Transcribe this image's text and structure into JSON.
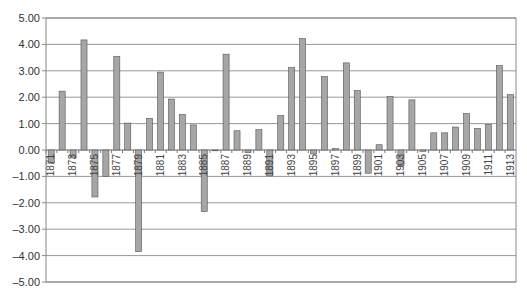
{
  "chart_data": {
    "type": "bar",
    "title": "",
    "xlabel": "",
    "ylabel": "",
    "ylim": [
      -5,
      5
    ],
    "yticks": [
      "5.00",
      "4.00",
      "3.00",
      "2.00",
      "1.00",
      "0.00",
      "-1.00",
      "-2.00",
      "-3.00",
      "-4.00",
      "-5.00"
    ],
    "grid": true,
    "legend": null,
    "bar_color": "#a6a6a6",
    "bar_edge_color": "#555555",
    "categories": [
      1871,
      1872,
      1873,
      1874,
      1875,
      1876,
      1877,
      1878,
      1879,
      1880,
      1881,
      1882,
      1883,
      1884,
      1885,
      1886,
      1887,
      1888,
      1889,
      1890,
      1891,
      1892,
      1893,
      1894,
      1895,
      1896,
      1897,
      1898,
      1899,
      1900,
      1901,
      1902,
      1903,
      1904,
      1905,
      1906,
      1907,
      1908,
      1909,
      1910,
      1911,
      1912,
      1913
    ],
    "shown_tick_labels": [
      "1871",
      "1873",
      "1875",
      "1877",
      "1879",
      "1881",
      "1883",
      "1885",
      "1887",
      "1889",
      "1891",
      "1893",
      "1895",
      "1897",
      "1899",
      "1901",
      "1903",
      "1905",
      "1907",
      "1909",
      "1911",
      "1913"
    ],
    "values": [
      -0.5,
      2.23,
      -0.3,
      4.17,
      -1.78,
      -1.0,
      3.55,
      1.02,
      -3.85,
      1.2,
      2.95,
      1.93,
      1.35,
      0.95,
      -2.33,
      -0.02,
      3.63,
      0.73,
      -0.1,
      0.77,
      -0.98,
      1.3,
      3.12,
      4.22,
      -0.15,
      2.78,
      0.05,
      3.3,
      2.25,
      -0.88,
      0.2,
      2.03,
      -0.6,
      1.9,
      -0.05,
      0.65,
      0.65,
      0.87,
      1.38,
      0.82,
      0.97,
      3.2,
      2.1
    ]
  }
}
